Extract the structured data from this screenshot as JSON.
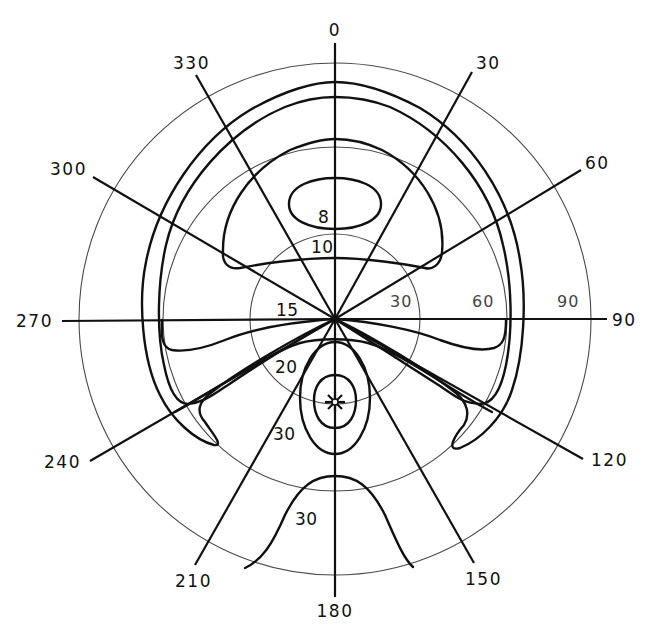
{
  "diagram": {
    "type": "polar contour plot",
    "azimuth_labels": [
      "0",
      "30",
      "60",
      "90",
      "120",
      "150",
      "180",
      "210",
      "240",
      "270",
      "300",
      "330"
    ],
    "ring_labels": [
      "30",
      "60",
      "90"
    ],
    "contour_labels": {
      "c8": "8",
      "c10": "10",
      "c15": "15",
      "c20": "20",
      "c30_inner": "30",
      "c30_bottom": "30"
    },
    "marker": "star-marker",
    "colors": {
      "ink": "#111111",
      "grid": "#4a4a4a",
      "background": "#ffffff"
    }
  }
}
